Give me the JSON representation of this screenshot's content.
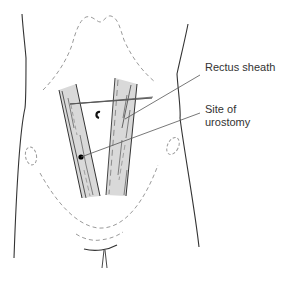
{
  "labels": {
    "rectus_sheath": "Rectus sheath",
    "site_line1": "Site of",
    "site_line2": "urostomy"
  },
  "colors": {
    "outline": "#333333",
    "dashed": "#9a9a9a",
    "sheath_fill": "#d9d9d9",
    "leader": "#555555",
    "text": "#333333"
  }
}
